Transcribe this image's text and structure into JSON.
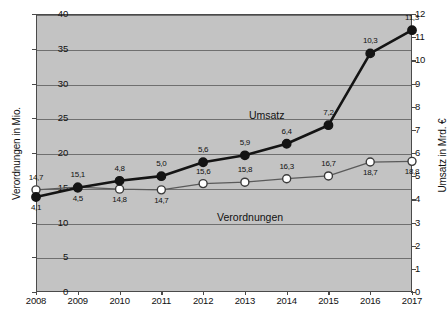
{
  "chart_data": {
    "type": "line",
    "title": "",
    "xlabel": "",
    "ylabel": "Verordnungen in Mio.",
    "y2label": "Umsatz in Mrd. €",
    "grid": true,
    "legend": "inline-labels",
    "categories": [
      "2008",
      "2009",
      "2010",
      "2011",
      "2012",
      "2013",
      "2014",
      "2015",
      "2016",
      "2017"
    ],
    "ylim": [
      0,
      40
    ],
    "y2lim": [
      0,
      12
    ],
    "yticks": [
      "0",
      "5",
      "10",
      "15",
      "20",
      "25",
      "30",
      "35",
      "40"
    ],
    "y2ticks": [
      "0",
      "1",
      "2",
      "3",
      "4",
      "5",
      "6",
      "7",
      "8",
      "9",
      "10",
      "11",
      "12"
    ],
    "series": [
      {
        "name": "Verordnungen",
        "axis": "left",
        "unit": "Mio.",
        "marker": "open-circle",
        "values": [
          14.7,
          15.1,
          14.8,
          14.7,
          15.6,
          15.8,
          16.3,
          16.7,
          18.7,
          18.8
        ],
        "labels": [
          "14,7",
          "15,1",
          "14,8",
          "14,7",
          "15,6",
          "15,8",
          "16,3",
          "16,7",
          "18,7",
          "18,8"
        ],
        "label_positions": [
          "above",
          "above",
          "below",
          "below",
          "above",
          "above",
          "above",
          "above",
          "below",
          "below"
        ]
      },
      {
        "name": "Umsatz",
        "axis": "right",
        "unit": "Mrd. €",
        "marker": "filled-circle",
        "values": [
          4.1,
          4.5,
          4.8,
          5.0,
          5.6,
          5.9,
          6.4,
          7.2,
          10.3,
          11.3
        ],
        "labels": [
          "4,1",
          "4,5",
          "4,8",
          "5,0",
          "5,6",
          "5,9",
          "6,4",
          "7,2",
          "10,3",
          "11,3"
        ],
        "label_positions": [
          "below",
          "below",
          "above",
          "above",
          "above",
          "above",
          "above",
          "above",
          "above",
          "above"
        ]
      }
    ],
    "annotations": [
      {
        "text": "Umsatz",
        "kind": "series-inline-label"
      },
      {
        "text": "Verordnungen",
        "kind": "series-inline-label"
      }
    ],
    "colors": {
      "plot_background": "#c3c3c3",
      "gridline": "#6f6f6f",
      "axis": "#4a4a4a",
      "umsatz_line": "#141414",
      "verordnungen_line": "#5a5a5a",
      "marker_open_fill": "#ffffff",
      "marker_filled_fill": "#141414",
      "text": "#111111"
    }
  }
}
